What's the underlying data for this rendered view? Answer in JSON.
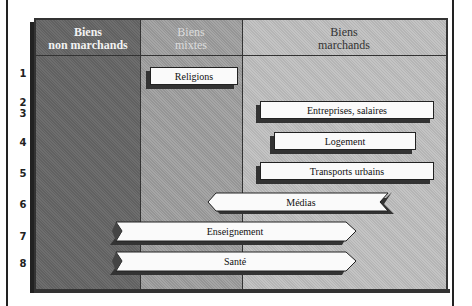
{
  "columns": [
    {
      "line1": "Biens",
      "line2": "non marchands",
      "shade": "#6e6e6e"
    },
    {
      "line1": "Biens",
      "line2": "mixtes",
      "shade": "#a6a6a6"
    },
    {
      "line1": "Biens",
      "line2": "marchands",
      "shade": "#c4c4c4"
    }
  ],
  "rows": [
    "1",
    "2",
    "3",
    "4",
    "5",
    "6",
    "7",
    "8"
  ],
  "items": [
    {
      "row": "1",
      "label": "Religions",
      "shape": "box",
      "span": "mixtes"
    },
    {
      "row": "2-3",
      "label": "Entreprises, salaires",
      "shape": "box",
      "span": "marchands"
    },
    {
      "row": "4",
      "label": "Logement",
      "shape": "box",
      "span": "marchands"
    },
    {
      "row": "5",
      "label": "Transports urbains",
      "shape": "box",
      "span": "marchands"
    },
    {
      "row": "6",
      "label": "Médias",
      "shape": "arrow-left",
      "span": "mixtes-marchands"
    },
    {
      "row": "7",
      "label": "Enseignement",
      "shape": "arrow-right",
      "span": "non marchands-marchands"
    },
    {
      "row": "8",
      "label": "Santé",
      "shape": "arrow-right",
      "span": "non marchands-marchands"
    }
  ]
}
